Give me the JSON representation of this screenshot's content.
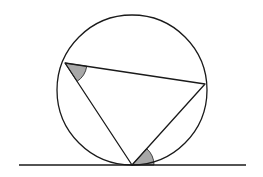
{
  "diagram": {
    "type": "geometry",
    "colors": {
      "stroke": "#1a1a1a",
      "shade": "#a8a8a8",
      "background": "#ffffff"
    },
    "circle": {
      "cx": 132,
      "cy": 90,
      "r": 75
    },
    "tangent_line": {
      "x1": 19,
      "y1": 165,
      "x2": 246,
      "y2": 165
    },
    "vertices": {
      "A": {
        "x": 65,
        "y": 63
      },
      "B": {
        "x": 205,
        "y": 84
      },
      "T": {
        "x": 132,
        "y": 165
      }
    },
    "shaded_angles": [
      {
        "at": "A",
        "between": [
          "B",
          "T"
        ],
        "radius": 22
      },
      {
        "at": "T",
        "between": [
          "B",
          "tangent-right"
        ],
        "radius": 22
      }
    ]
  }
}
